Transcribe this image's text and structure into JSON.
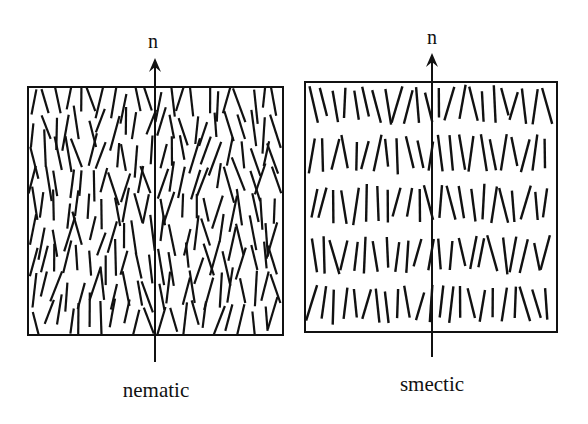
{
  "diagram": {
    "panels": [
      {
        "id": "nematic",
        "label": "nematic",
        "director_label": "n",
        "box": {
          "x": 28,
          "y": 87,
          "w": 255,
          "h": 248
        },
        "arrow": {
          "x": 155,
          "y_top": 58,
          "y_bottom": 362
        },
        "arrangement": "orientational order, random positions"
      },
      {
        "id": "smectic",
        "label": "smectic",
        "director_label": "n",
        "box": {
          "x": 305,
          "y": 82,
          "w": 252,
          "h": 250
        },
        "arrow": {
          "x": 432,
          "y_top": 53,
          "y_bottom": 357
        },
        "layers": 5,
        "arrangement": "orientational order, molecules in layers"
      }
    ],
    "colors": {
      "ink": "#111111",
      "background": "#ffffff"
    }
  }
}
